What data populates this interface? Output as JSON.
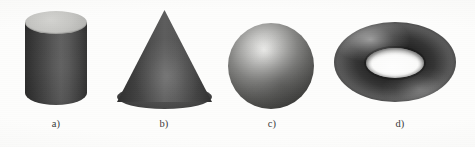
{
  "figure": {
    "background_color": "#fdfdfc",
    "label_color": "#3b3b3b",
    "shapes": [
      {
        "id": "cylinder",
        "name": "cylinder",
        "caption": "a)",
        "top_face_color": "#c6c6c3",
        "body_dark_color": "#2e2e2e",
        "body_light_color": "#626262"
      },
      {
        "id": "cone",
        "name": "cone",
        "caption": "b)",
        "base_color": "#4a4a4a",
        "face_dark_color": "#2f2f2f",
        "face_light_color": "#5d5d5d"
      },
      {
        "id": "sphere",
        "name": "sphere",
        "caption": "c)",
        "highlight_color": "#f3f3f1",
        "mid_color": "#878785",
        "shadow_color": "#2c2c2a"
      },
      {
        "id": "torus",
        "name": "torus",
        "caption": "d)",
        "highlight_color": "#5d5d5d",
        "dark_color": "#1f1f1f",
        "hole_color": "#fefefe"
      }
    ]
  }
}
